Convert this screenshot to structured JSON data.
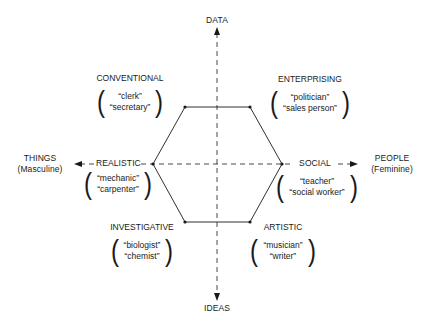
{
  "axes": {
    "top": "DATA",
    "bottom": "IDEAS",
    "left": {
      "line1": "THINGS",
      "line2": "(Masculine)"
    },
    "right": {
      "line1": "PEOPLE",
      "line2": "(Feminine)"
    }
  },
  "types": {
    "conventional": {
      "title": "CONVENTIONAL",
      "examples": [
        "“clerk”",
        "“secretary”"
      ]
    },
    "enterprising": {
      "title": "ENTERPRISING",
      "examples": [
        "“politician”",
        "“sales person”"
      ]
    },
    "realistic": {
      "title": "REALISTIC",
      "examples": [
        "“mechanic”",
        "“carpenter”"
      ]
    },
    "social": {
      "title": "SOCIAL",
      "examples": [
        "“teacher”",
        "“social worker”"
      ]
    },
    "investigative": {
      "title": "INVESTIGATIVE",
      "examples": [
        "“biologist”",
        "“chemist”"
      ]
    },
    "artistic": {
      "title": "ARTISTIC",
      "examples": [
        "“musician”",
        "“writer”"
      ]
    }
  },
  "colors": {
    "line": "#1a1a1a",
    "background": "#ffffff"
  }
}
